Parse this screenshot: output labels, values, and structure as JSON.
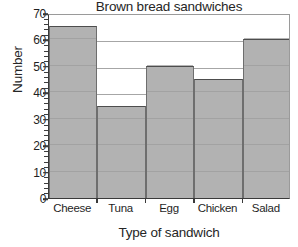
{
  "chart_data": {
    "type": "bar",
    "title": "Brown bread sandwiches",
    "xlabel": "Type of sandwich",
    "ylabel": "Number",
    "categories": [
      "Cheese",
      "Tuna",
      "Egg",
      "Chicken",
      "Salad"
    ],
    "values": [
      65,
      35,
      50,
      45,
      60
    ],
    "ylim": [
      0,
      70
    ],
    "y_tick_step": 10,
    "y_minor_tick_step": 2,
    "y_ticks": [
      0,
      10,
      20,
      30,
      40,
      50,
      60,
      70
    ],
    "y_tick_labels": [
      "0",
      "10",
      "20",
      "30",
      "40",
      "50",
      "60",
      "70"
    ],
    "grid": "horizontal",
    "legend": "none",
    "bars_contiguous": true,
    "colors": {
      "bar_fill": "#b2b2b2",
      "bar_outline": "#4d4d4d",
      "gridline": "#a6a6a6",
      "axis": "#3a3a3a",
      "text": "#1f1f1f",
      "background": "#ffffff"
    }
  }
}
